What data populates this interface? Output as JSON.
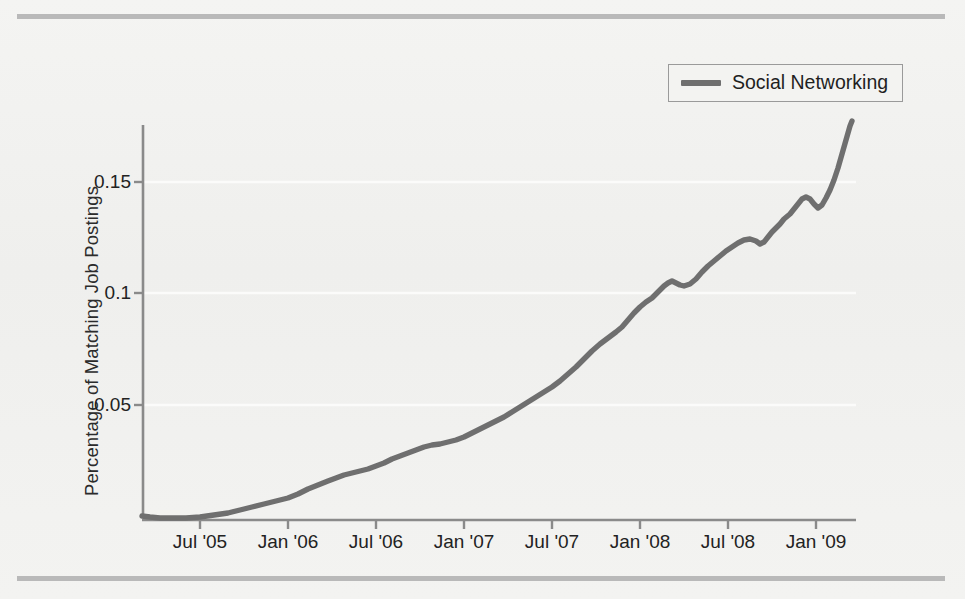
{
  "figure": {
    "background_color": "#f2f2f0",
    "line_color": "#6f6f6f",
    "axis_color": "#8a8a8a",
    "text_color": "#222222"
  },
  "legend": {
    "position": "top-right",
    "entries": [
      {
        "label": "Social Networking",
        "color": "#6f6f6f",
        "swatch": "line-swatch"
      }
    ]
  },
  "chart_data": {
    "type": "line",
    "title": "",
    "subtitle": "",
    "xlabel": "",
    "ylabel": "Percentage of Matching Job Postings",
    "grid": true,
    "grid_color": "#fbfbfa",
    "legend_position": "top-right",
    "xlim": [
      "2005-01",
      "2009-07"
    ],
    "ylim": [
      0,
      0.186
    ],
    "yticks": [
      0.05,
      0.1,
      0.15
    ],
    "ytick_labels": [
      "0.05",
      "0.1",
      "0.15"
    ],
    "xticks": [
      "2005-01",
      "2005-07",
      "2006-01",
      "2006-07",
      "2007-01",
      "2007-07",
      "2008-01",
      "2008-07",
      "2009-01",
      "2009-07"
    ],
    "xtick_labels": [
      "",
      "Jul '05",
      "Jan '06",
      "Jul '06",
      "Jan '07",
      "Jul '07",
      "Jan '08",
      "Jul '08",
      "Jan '09",
      ""
    ],
    "series": [
      {
        "name": "Social Networking",
        "color": "#6f6f6f",
        "x": [
          "2005-01",
          "2005-02",
          "2005-03",
          "2005-04",
          "2005-05",
          "2005-06",
          "2005-07",
          "2005-08",
          "2005-09",
          "2005-10",
          "2005-11",
          "2005-12",
          "2006-01",
          "2006-02",
          "2006-03",
          "2006-04",
          "2006-05",
          "2006-06",
          "2006-07",
          "2006-08",
          "2006-09",
          "2006-10",
          "2006-11",
          "2006-12",
          "2007-01",
          "2007-02",
          "2007-03",
          "2007-04",
          "2007-05",
          "2007-06",
          "2007-07",
          "2007-08",
          "2007-09",
          "2007-10",
          "2007-11",
          "2007-12",
          "2008-01",
          "2008-02",
          "2008-03",
          "2008-04",
          "2008-05",
          "2008-06",
          "2008-07",
          "2008-08",
          "2008-09",
          "2008-10",
          "2008-11",
          "2008-12",
          "2009-01",
          "2009-02",
          "2009-03",
          "2009-04",
          "2009-05",
          "2009-06",
          "2009-07"
        ],
        "values": [
          0.0022,
          0.0018,
          0.0016,
          0.0014,
          0.0013,
          0.0013,
          0.0014,
          0.0016,
          0.0019,
          0.0023,
          0.0028,
          0.0034,
          0.004,
          0.0048,
          0.0057,
          0.0063,
          0.0072,
          0.008,
          0.0088,
          0.0098,
          0.0112,
          0.0128,
          0.014,
          0.015,
          0.016,
          0.017,
          0.0182,
          0.0196,
          0.0212,
          0.023,
          0.0252,
          0.0282,
          0.031,
          0.034,
          0.0368,
          0.038,
          0.0388,
          0.0402,
          0.044,
          0.048,
          0.052,
          0.056,
          0.061,
          0.066,
          0.07,
          0.0725,
          0.0742,
          0.073,
          0.076,
          0.083,
          0.09,
          0.096,
          0.1005,
          0.104,
          0.1072
        ]
      }
    ],
    "series_extended_note": "",
    "y_units": "fraction of postings"
  },
  "curve_pixels": {
    "comment": "sampled polyline in chart pixel space",
    "points": "142,516 150,517 160,518 172,518 186,518 200,517 214,515 228,513 240,510 252,507 264,504 276,501 288,498 298,494 308,489 318,485 328,481 336,478 344,475 352,473 360,471 368,469 376,466 384,463 392,459 400,456 408,453 416,450 424,447 432,445 440,444 448,442 456,440 464,437 472,433 480,429 488,425 496,421 504,417 512,412 520,407 528,402 536,397 544,392 552,387 560,381 568,374 576,367 584,359 592,351 600,344 608,338 616,332 622,327 628,320 634,313 640,307 646,302 652,298 656,294 660,290 664,286 668,283 672,281 676,283 680,285 684,286 690,284 696,279 702,272 708,266 714,261 720,256 726,251 732,247 738,243 744,240 750,239 756,241 760,244 764,242 768,237 772,232 776,228 780,224 784,219 790,214 794,209 798,204 802,199 806,197 810,199 814,204 818,208 822,205 826,198 830,190 834,180 838,168 842,154 846,140 850,126 852,121"
  },
  "axes_pixels": {
    "plot_left": 142,
    "plot_right": 856,
    "y_zero": 517,
    "y_0_05": 405,
    "y_0_1": 293,
    "y_0_15": 182,
    "axis_top": 125
  }
}
